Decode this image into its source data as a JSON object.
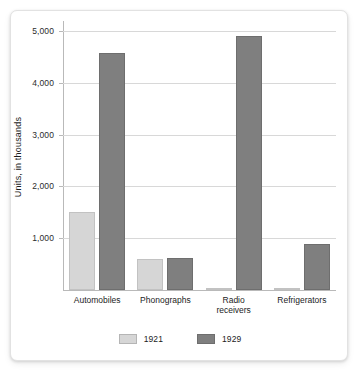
{
  "chart_data": {
    "type": "bar",
    "title": "",
    "xlabel": "",
    "ylabel": "Units, in thousands",
    "ylim": [
      0,
      5000
    ],
    "yticks": [
      1000,
      2000,
      3000,
      4000,
      5000
    ],
    "ytick_labels": [
      "1,000",
      "2,000",
      "3,000",
      "4,000",
      "5,000"
    ],
    "grid": true,
    "legend_position": "bottom",
    "categories": [
      "Automobiles",
      "Phonographs",
      "Radio receivers",
      "Refrigerators"
    ],
    "category_labels": [
      [
        "Automobiles"
      ],
      [
        "Phonographs"
      ],
      [
        "Radio",
        "receivers"
      ],
      [
        "Refrigerators"
      ]
    ],
    "series": [
      {
        "name": "1921",
        "color": "#d6d6d6",
        "values": [
          1500,
          600,
          10,
          5
        ]
      },
      {
        "name": "1929",
        "color": "#7f7f7f",
        "values": [
          4570,
          620,
          4900,
          890
        ]
      }
    ]
  },
  "legend": {
    "items": [
      {
        "label": "1921",
        "swatch": "light-gray"
      },
      {
        "label": "1929",
        "swatch": "dark-gray"
      }
    ]
  }
}
